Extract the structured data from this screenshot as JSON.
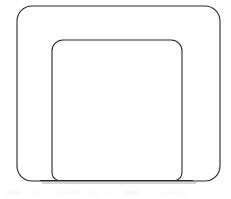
{
  "figure": {
    "background_color": "#ffffff",
    "stroke_color": "#262626",
    "shadow_color": "#b0b0b0",
    "baseline_shadow_color": "#c8c8c8",
    "width": 231,
    "height": 199
  },
  "shapes": {
    "outer_body": {
      "name": "outer-rounded-rectangle",
      "x": 17,
      "y": 6,
      "width": 203,
      "height": 175,
      "corner_radius": 15,
      "stroke_width": 1.1
    },
    "inner_body": {
      "name": "inner-rounded-rectangle",
      "x": 52,
      "y": 40,
      "width": 130,
      "height": 141,
      "corner_radius": 11,
      "stroke_width": 1.1
    },
    "baseline": {
      "name": "ground-line",
      "x1": 40,
      "y1": 180,
      "x2": 193,
      "y2": 180,
      "stroke_width": 1.1
    },
    "baseline_shadow": {
      "name": "ground-line-shadow",
      "x1": 42,
      "y1": 183,
      "x2": 196,
      "y2": 183,
      "stroke_width": 1.6
    }
  },
  "watermark": {
    "visible": true,
    "lines": [
      "ihna",
      "wdsl",
      "iln ilnaiii",
      "nal",
      "iln",
      "lilihn",
      "al",
      "iiilnasii"
    ]
  }
}
